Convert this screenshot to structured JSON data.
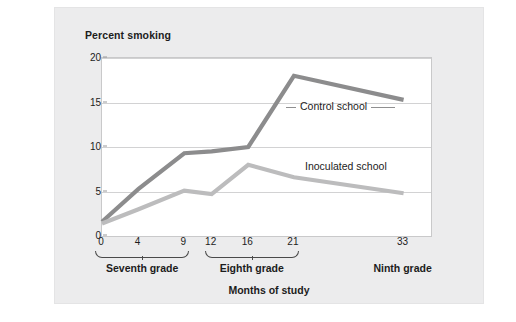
{
  "chart_data": {
    "type": "line",
    "title": "Percent smoking",
    "xlabel": "Months of study",
    "ylabel": "Percent smoking",
    "x": [
      0,
      4,
      9,
      12,
      16,
      21,
      33
    ],
    "xticklabels": [
      "0",
      "4",
      "9",
      "12",
      "16",
      "21",
      "33"
    ],
    "yticklabels": [
      "0",
      "5",
      "10",
      "15",
      "20"
    ],
    "yticks": [
      0,
      5,
      10,
      15,
      20
    ],
    "ylim": [
      0,
      20
    ],
    "xlim": [
      0,
      36
    ],
    "grid": "horizontal",
    "legend": "inline-annotations",
    "series": [
      {
        "name": "Control school",
        "color": "#8c8c8d",
        "values": [
          1.6,
          5.3,
          9.3,
          9.5,
          10.0,
          18.0,
          15.3
        ]
      },
      {
        "name": "Inoculated school",
        "color": "#bcbcbd",
        "values": [
          1.4,
          3.0,
          5.1,
          4.7,
          8.0,
          6.6,
          4.8
        ]
      }
    ],
    "groups": [
      {
        "label": "Seventh grade",
        "from": 0,
        "to": 9
      },
      {
        "label": "Eighth grade",
        "from": 12,
        "to": 21
      },
      {
        "label": "Ninth grade",
        "from": 33,
        "to": 33
      }
    ],
    "annotations": [
      {
        "text": "Control school",
        "series": "Control school"
      },
      {
        "text": "Inoculated school",
        "series": "Inoculated school"
      }
    ]
  },
  "colors": {
    "card_background": "#ececed",
    "plot_background": "#ffffff",
    "gridline": "#d2d2d3",
    "axis": "#9a9a9b",
    "text": "#1c1c1c",
    "control_series": "#8c8c8d",
    "inoculated_series": "#bcbcbd"
  }
}
